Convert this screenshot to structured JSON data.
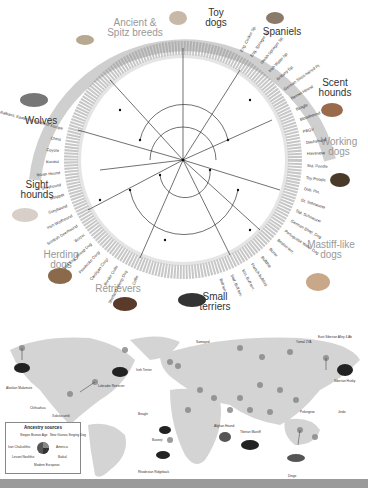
{
  "figure": {
    "tree_groups": [
      {
        "id": "ancient",
        "label_line1": "Ancient &",
        "label_line2": "Spitz breeds"
      },
      {
        "id": "toy",
        "label_line1": "Toy",
        "label_line2": "dogs"
      },
      {
        "id": "spaniels",
        "label_line1": "Spaniels",
        "label_line2": ""
      },
      {
        "id": "scent",
        "label_line1": "Scent",
        "label_line2": "hounds"
      },
      {
        "id": "working",
        "label_line1": "Working",
        "label_line2": "dogs"
      },
      {
        "id": "mastiff",
        "label_line1": "Mastiff-like",
        "label_line2": "dogs"
      },
      {
        "id": "terriers",
        "label_line1": "Small",
        "label_line2": "terriers"
      },
      {
        "id": "retrievers",
        "label_line1": "Retrievers",
        "label_line2": ""
      },
      {
        "id": "herding",
        "label_line1": "Herding",
        "label_line2": "dogs"
      },
      {
        "id": "sight",
        "label_line1": "Sight",
        "label_line2": "hounds"
      },
      {
        "id": "wolves",
        "label_line1": "Wolves",
        "label_line2": ""
      }
    ],
    "leaf_labels_right": [
      "Eng. Cocker Sp.",
      "Eng. Springer Sp.",
      "Welsh Springer Sp.",
      "Irish Water Sp.",
      "Brittany Sp.",
      "German Short-haired Pt.",
      "Basset Hound",
      "Beagle",
      "Bloodhound",
      "PBGV",
      "Dachshund",
      "Havanese",
      "Std. Poodle",
      "Toy Poodle",
      "Dob. Pin.",
      "Gt. Schnauzer",
      "Std. Schnauzer",
      "German Shep. Dog",
      "Portuguese Water Dog",
      "Boston terr.",
      "Boxer",
      "Bulldog",
      "French bulldog",
      "Min. Bull terr.",
      "Staf. Bull terr.",
      "Bull terr."
    ],
    "leaf_labels_left": [
      "Balkans, Eastern & Northern Europe",
      "China",
      "Coyote",
      "Kuvasz",
      "Ibizan Hound",
      "It. Greyhound",
      "Whippet",
      "Greyhound",
      "Irish Wolfhound",
      "Scottish Deerhound",
      "Borzoi",
      "Old Eng. Sheep Dog",
      "Pembroke Corgi",
      "Cardigan Corgi",
      "Border Collie",
      "Shetland Sheep Dog",
      "Collie"
    ],
    "leaf_labels_top_left": [
      "Italy",
      "Middle East",
      "Alaskan Malamute",
      "Siberian Husky",
      "Akita",
      "Shar-Pei",
      "Basenji",
      "Afghan Hound",
      "Saluki"
    ],
    "map": {
      "dog_labels": [
        "Alaskan Malamute",
        "Chihuahua",
        "Xoloitzcuintli",
        "Labrador Retriever",
        "Irish Terrier",
        "Beagle",
        "Basenji",
        "Rhodesian Ridgeback",
        "Afghan Hound",
        "Tibetan Mastiff",
        "Pekingese",
        "Jindo",
        "Siberian Husky",
        "Dingo",
        "Samoyed"
      ],
      "site_labels": [
        "Yamal 2YA",
        "East Siberian Alley 4 Ab"
      ]
    },
    "legend": {
      "title": "Ancestry sources",
      "sources": [
        "Steppe Bronze Age",
        "New Guinea Singing Dog",
        "Iran Chalcolithic",
        "America",
        "Levant Neolithic",
        "Baikal",
        "Modern European"
      ]
    },
    "colors": {
      "tree_gray": "#777777",
      "map_land": "#d4d4d4",
      "circle": "#8a8a8a",
      "bar": "#9a9a9a"
    }
  }
}
